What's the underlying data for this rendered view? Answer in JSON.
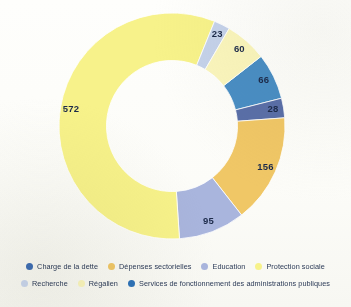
{
  "chart_data": {
    "type": "pie",
    "variant": "donut",
    "title": "",
    "subtitle": "",
    "xlabel": "",
    "ylabel": "",
    "grid": false,
    "legend_position": "bottom",
    "total": 1000,
    "start_angle_deg": -38,
    "inner_radius_ratio": 0.58,
    "categories": [
      "Charge de la dette",
      "Services de fonctionnement des administrations publiques",
      "Dépenses sectorielles",
      "Education",
      "Protection sociale",
      "Recherche",
      "Régalien"
    ],
    "values": [
      66,
      28,
      156,
      95,
      572,
      23,
      60
    ],
    "colors": [
      "#4a8ec4",
      "#5a6fa8",
      "#f0c766",
      "#a9b5dd",
      "#f7f28a",
      "#c5d2ea",
      "#faf5bc"
    ],
    "data_labels": [
      "66",
      "28",
      "156",
      "95",
      "572",
      "23",
      "60"
    ],
    "slices": [
      {
        "label": "Charge de la dette",
        "value": 66,
        "display": "66",
        "color": "#4a8ec4"
      },
      {
        "label": "Services de fonctionnement des administrations publiques",
        "value": 28,
        "display": "28",
        "color": "#5a6fa8"
      },
      {
        "label": "Dépenses sectorielles",
        "value": 156,
        "display": "156",
        "color": "#f0c766"
      },
      {
        "label": "Education",
        "value": 95,
        "display": "95",
        "color": "#a9b5dd"
      },
      {
        "label": "Protection sociale",
        "value": 572,
        "display": "572",
        "color": "#f7f28a"
      },
      {
        "label": "Recherche",
        "value": 23,
        "display": "23",
        "color": "#c5d2ea"
      },
      {
        "label": "Régalien",
        "value": 60,
        "display": "60",
        "color": "#faf5bc"
      }
    ]
  },
  "legend": {
    "rows": [
      [
        {
          "label": "Charge de la dette",
          "color": "#3f6fb5"
        },
        {
          "label": "Dépenses sectorielles",
          "color": "#f0c766"
        },
        {
          "label": "Education",
          "color": "#a9b5dd"
        },
        {
          "label": "Protection sociale",
          "color": "#f7f28a"
        }
      ],
      [
        {
          "label": "Recherche",
          "color": "#c9d6ee"
        },
        {
          "label": "Régalien",
          "color": "#faf5bc"
        },
        {
          "label": "Services de fonctionnement des administrations publiques",
          "color": "#2f73b8"
        }
      ]
    ]
  }
}
